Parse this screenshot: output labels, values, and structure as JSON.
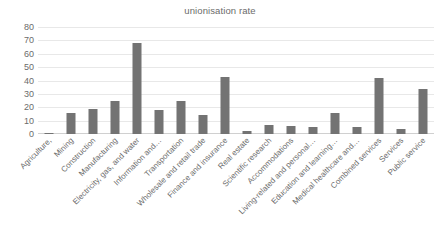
{
  "chart_data": {
    "type": "bar",
    "title": "unionisation rate",
    "xlabel": "",
    "ylabel": "",
    "ylim": [
      0,
      80
    ],
    "yticks": [
      0,
      10,
      20,
      30,
      40,
      50,
      60,
      70,
      80
    ],
    "grid": true,
    "legend": "none",
    "bar_color": "#737373",
    "categories": [
      "Agriculture,",
      "Mining",
      "Construction",
      "Manufacturing",
      "Electricity, gas, and water",
      "Information and…",
      "Transportation",
      "Wholesale and retail trade",
      "Finance and insurance",
      "Real estate",
      "Scientific research",
      "Accommodations",
      "Living-related and personal…",
      "Education and learning…",
      "Medical healthcare and…",
      "Combined services",
      "Services",
      "Public service"
    ],
    "values": [
      1,
      16,
      19,
      25,
      68,
      18,
      25,
      14,
      43,
      2,
      7,
      6,
      5,
      16,
      5,
      42,
      4,
      34
    ]
  }
}
